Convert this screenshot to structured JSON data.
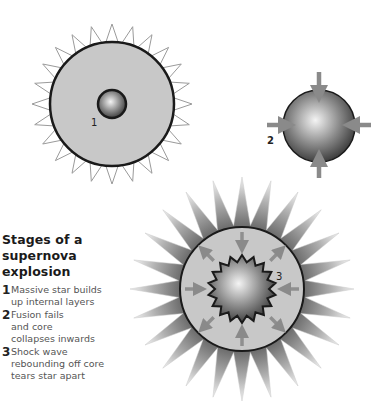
{
  "legend": {
    "title": "Stages of a supernova explosion",
    "items": [
      {
        "number": "1",
        "text": "Massive star builds\nup internal layers"
      },
      {
        "number": "2",
        "text": "Fusion fails\nand core\ncollapses inwards"
      },
      {
        "number": "3",
        "text": "Shock wave\nrebounding off core\ntears star apart"
      }
    ]
  },
  "labels": {
    "stage1": "1",
    "stage2": "2",
    "stage3": "3"
  },
  "colors": {
    "shell": "#c8c8c8",
    "outline": "#1a1a1a",
    "arrow": "#8a8a8a",
    "spike_outline": "#9a9a9a"
  }
}
